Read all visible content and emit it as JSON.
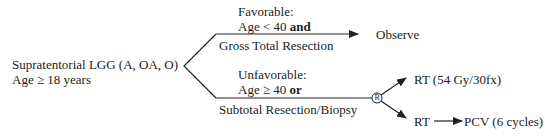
{
  "root": {
    "line1": "Supratentorial LGG (A, OA, O)",
    "line2": "Age ≥ 18 years"
  },
  "favorable": {
    "label": "Favorable:",
    "criterion_prefix": "Age < 40 ",
    "criterion_conj": "and",
    "branch_label": "Gross Total Resection",
    "outcome": "Observe"
  },
  "unfavorable": {
    "label": "Unfavorable:",
    "criterion_prefix": "Age ≥ 40 ",
    "criterion_conj": "or",
    "branch_label": "Subtotal Resection/Biopsy",
    "randomize_symbol": "R",
    "arm1": "RT (54 Gy/30fx)",
    "arm2_first": "RT",
    "arm2_second": "PCV (6 cycles)"
  },
  "colors": {
    "line": "#222222",
    "text": "#222222"
  }
}
